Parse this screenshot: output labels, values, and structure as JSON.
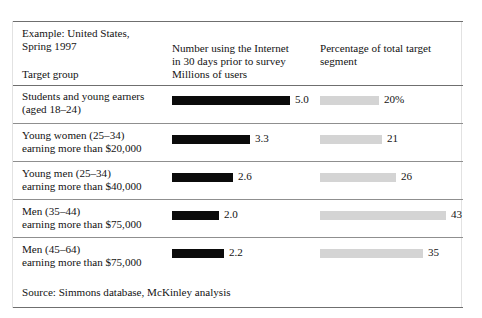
{
  "figure": {
    "title_lines": [
      "Example: United States,",
      "Spring 1997"
    ],
    "target_group_label": "Target group",
    "columns": {
      "number_header_lines": [
        "Number using the Internet",
        "in 30 days prior to survey",
        "Millions of users"
      ],
      "percent_header_lines": [
        "Percentage of total target",
        "segment"
      ]
    },
    "source": "Source: Simmons database, McKinley analysis",
    "colors": {
      "bar_users": "#0b0b0b",
      "bar_percent": "#d4d4d4",
      "rule": "#6f6f6f",
      "row_divider": "#8f8f8f",
      "text": "#131313"
    }
  },
  "chart_data": {
    "type": "bar",
    "title": "Example: United States, Spring 1997",
    "orientation": "horizontal",
    "grid": false,
    "legend": "none",
    "categories": [
      "Students and young earners (aged 18–24)",
      "Young women (25–34) earning more than $20,000",
      "Young men (25–34) earning more than $40,000",
      "Men (35–44) earning more than $75,000",
      "Men (45–64) earning more than $75,000"
    ],
    "series": [
      {
        "name": "Number using the Internet in 30 days prior to survey (Millions of users)",
        "unit": "millions",
        "values": [
          5.0,
          3.3,
          2.6,
          2.0,
          2.2
        ],
        "labels": [
          "5.0",
          "3.3",
          "2.6",
          "2.0",
          "2.2"
        ],
        "xlim": [
          0,
          5.0
        ],
        "color": "#0b0b0b"
      },
      {
        "name": "Percentage of total target segment",
        "unit": "percent",
        "values": [
          20,
          21,
          26,
          43,
          35
        ],
        "labels": [
          "20%",
          "21",
          "26",
          "43",
          "35"
        ],
        "xlim": [
          0,
          43
        ],
        "color": "#d4d4d4"
      }
    ],
    "xlabel": "",
    "ylabel": "Target group",
    "source": "Source: Simmons database, McKinley analysis"
  },
  "rows": [
    {
      "label_lines": [
        "Students and young earners",
        "(aged 18–24)"
      ],
      "users_value": 5.0,
      "users_label": "5.0",
      "percent_value": 20,
      "percent_label": "20%"
    },
    {
      "label_lines": [
        "Young women (25–34)",
        "earning more than $20,000"
      ],
      "users_value": 3.3,
      "users_label": "3.3",
      "percent_value": 21,
      "percent_label": "21"
    },
    {
      "label_lines": [
        "Young men (25–34)",
        "earning more than $40,000"
      ],
      "users_value": 2.6,
      "users_label": "2.6",
      "percent_value": 26,
      "percent_label": "26"
    },
    {
      "label_lines": [
        "Men (35–44)",
        "earning more than $75,000"
      ],
      "users_value": 2.0,
      "users_label": "2.0",
      "percent_value": 43,
      "percent_label": "43"
    },
    {
      "label_lines": [
        "Men (45–64)",
        "earning more than $75,000"
      ],
      "users_value": 2.2,
      "users_label": "2.2",
      "percent_value": 35,
      "percent_label": "35"
    }
  ]
}
